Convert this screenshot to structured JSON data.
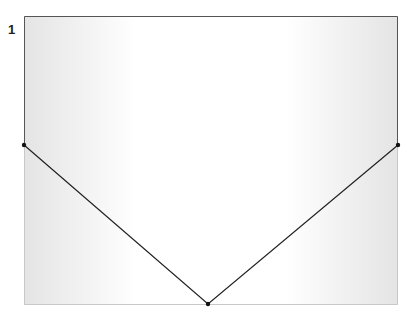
{
  "figure": {
    "label": "1",
    "frame": {
      "x": 24,
      "y": 16,
      "width": 374,
      "height": 288
    },
    "shape": {
      "type": "v-shape",
      "points": [
        {
          "x": 24,
          "y": 145
        },
        {
          "x": 208,
          "y": 304
        },
        {
          "x": 398,
          "y": 145
        }
      ]
    },
    "colors": {
      "line": "#222222",
      "frame_dark": "#555555",
      "frame_light": "#c8c8c8",
      "fill_edge": "#e6e6e6",
      "fill_center": "#ffffff"
    }
  }
}
